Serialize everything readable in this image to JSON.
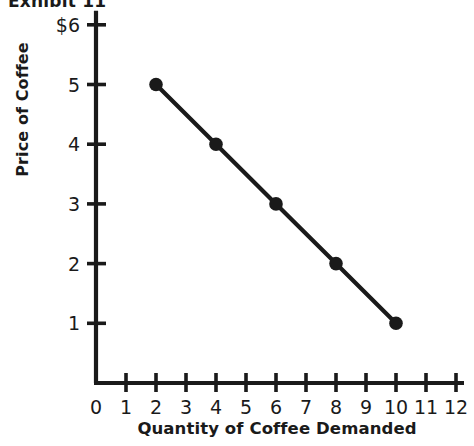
{
  "exhibit": {
    "label": "Exhibit 11"
  },
  "chart_data": {
    "type": "line",
    "title": "",
    "subtitle": "",
    "xlabel": "Quantity of Coffee Demanded",
    "ylabel": "Price of Coffee",
    "xlim": [
      0,
      12
    ],
    "ylim": [
      0,
      6
    ],
    "grid": false,
    "legend": null,
    "legend_position": "none",
    "x_tick_labels": [
      "0",
      "1",
      "2",
      "3",
      "4",
      "5",
      "6",
      "7",
      "8",
      "9",
      "10",
      "11",
      "12"
    ],
    "x_ticks": [
      0,
      1,
      2,
      3,
      4,
      5,
      6,
      7,
      8,
      9,
      10,
      11,
      12
    ],
    "y_tick_labels": [
      "1",
      "2",
      "3",
      "4",
      "5",
      "$6"
    ],
    "y_ticks": [
      1,
      2,
      3,
      4,
      5,
      6
    ],
    "series": [
      {
        "name": "Demand",
        "marker": "circle",
        "color": "#1a1a1a",
        "x": [
          2,
          4,
          6,
          8,
          10
        ],
        "y": [
          5,
          4,
          3,
          2,
          1
        ],
        "points": [
          {
            "x": 2,
            "y": 5
          },
          {
            "x": 4,
            "y": 4
          },
          {
            "x": 6,
            "y": 3
          },
          {
            "x": 8,
            "y": 2
          },
          {
            "x": 10,
            "y": 1
          }
        ]
      }
    ],
    "annotations": []
  },
  "style": {
    "axis_color": "#1a1a1a",
    "line_color": "#1a1a1a",
    "marker_color": "#1a1a1a",
    "background": "#ffffff"
  }
}
